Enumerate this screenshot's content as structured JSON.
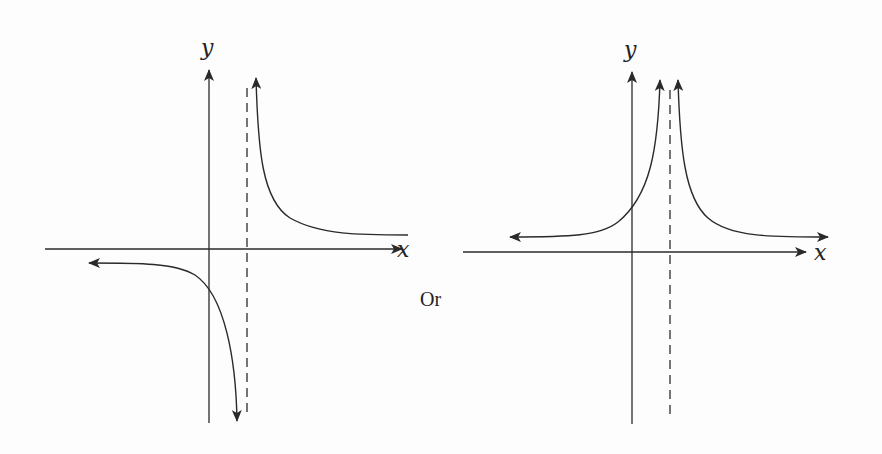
{
  "figure": {
    "connector_text": "Or",
    "graphs": [
      {
        "id": "left",
        "description": "Odd-order vertical asymptote: curve goes to -infinity on the left of the asymptote and +infinity on the right; horizontal asymptote approached from below on left and from above on right",
        "x_label": "x",
        "y_label": "y",
        "origin_px": [
          209,
          249
        ],
        "x_axis_px": [
          45,
          403
        ],
        "y_axis_px": [
          68,
          423
        ],
        "vertical_asymptote_x_px": 247,
        "branches": [
          {
            "name": "left-branch",
            "behavior": "approaches horizontal asymptote below x-axis to the left, descends to -infinity near vertical asymptote"
          },
          {
            "name": "right-branch",
            "behavior": "rises to +infinity near vertical asymptote, approaches horizontal asymptote above x-axis to the right"
          }
        ]
      },
      {
        "id": "right",
        "description": "Even-order vertical asymptote: both branches go to +infinity on either side of the asymptote; horizontal asymptote above x-axis approached on both sides",
        "x_label": "x",
        "y_label": "y",
        "origin_px": [
          632,
          252
        ],
        "x_axis_px": [
          463,
          808
        ],
        "y_axis_px": [
          70,
          424
        ],
        "vertical_asymptote_x_px": 670,
        "branches": [
          {
            "name": "left-branch",
            "behavior": "approaches horizontal asymptote to the left, rises to +infinity near vertical asymptote"
          },
          {
            "name": "right-branch",
            "behavior": "rises to +infinity near vertical asymptote, approaches horizontal asymptote to the right"
          }
        ]
      }
    ]
  }
}
